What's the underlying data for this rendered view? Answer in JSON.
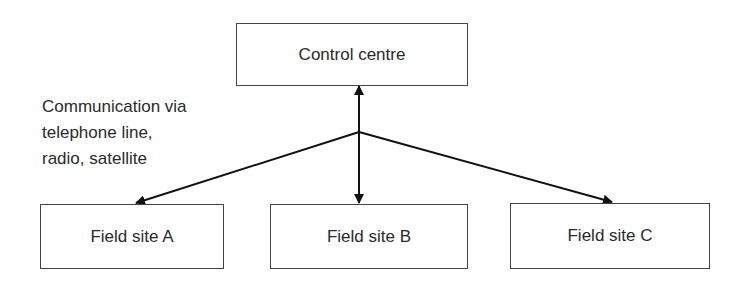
{
  "nodes": {
    "control": {
      "label": "Control centre"
    },
    "site_a": {
      "label": "Field site A"
    },
    "site_b": {
      "label": "Field site B"
    },
    "site_c": {
      "label": "Field site C"
    }
  },
  "annotation": {
    "text": "Communication via\ntelephone line,\nradio, satellite"
  },
  "edges": [
    {
      "from": "junction",
      "to": "control",
      "type": "arrow"
    },
    {
      "from": "junction",
      "to": "site_a",
      "type": "arrow"
    },
    {
      "from": "junction",
      "to": "site_b",
      "type": "arrow"
    },
    {
      "from": "junction",
      "to": "site_c",
      "type": "arrow"
    }
  ]
}
